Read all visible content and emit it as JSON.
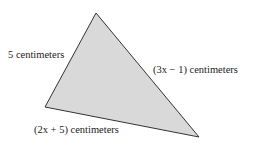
{
  "diagram": {
    "shape": "triangle",
    "fill": "#d9d9d9",
    "stroke": "#333333",
    "vertices": {
      "top": [
        96,
        13
      ],
      "left": [
        45,
        107
      ],
      "right": [
        199,
        137
      ]
    },
    "labels": {
      "left_side": "5 centimeters",
      "right_side": "(3x − 1) centimeters",
      "bottom_side": "(2x + 5) centimeters"
    }
  }
}
